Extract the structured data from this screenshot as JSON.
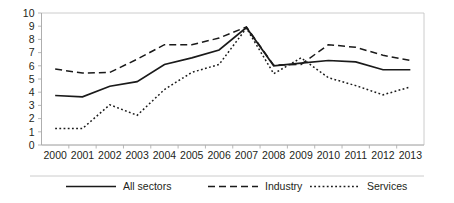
{
  "chart_data": {
    "type": "line",
    "title": "",
    "xlabel": "",
    "ylabel": "",
    "grid": false,
    "legend_position": "bottom",
    "ylim": [
      0,
      10
    ],
    "yticks": [
      0,
      1,
      2,
      3,
      4,
      5,
      6,
      7,
      8,
      9,
      10
    ],
    "categories": [
      "2000",
      "2001",
      "2002",
      "2003",
      "2004",
      "2005",
      "2006",
      "2007",
      "2008",
      "2009",
      "2010",
      "2011",
      "2012",
      "2013"
    ],
    "series": [
      {
        "name": "All sectors",
        "style": "solid",
        "values": [
          3.75,
          3.65,
          4.45,
          4.8,
          6.1,
          6.6,
          7.2,
          8.9,
          6.0,
          6.2,
          6.4,
          6.3,
          5.7,
          5.7
        ]
      },
      {
        "name": "Industry",
        "style": "dashed",
        "values": [
          5.75,
          5.45,
          5.5,
          6.5,
          7.6,
          7.6,
          8.1,
          8.95,
          6.05,
          6.1,
          7.6,
          7.4,
          6.8,
          6.4
        ]
      },
      {
        "name": "Services",
        "style": "dotted",
        "values": [
          1.25,
          1.25,
          3.05,
          2.25,
          4.2,
          5.5,
          6.1,
          8.85,
          5.4,
          6.6,
          5.1,
          4.5,
          3.8,
          4.4
        ]
      }
    ]
  },
  "axis": {
    "y_tick_labels": [
      "10",
      "9",
      "8",
      "7",
      "6",
      "5",
      "4",
      "3",
      "2",
      "1",
      "0"
    ],
    "x_tick_labels": [
      "2000",
      "2001",
      "2002",
      "2003",
      "2004",
      "2005",
      "2006",
      "2007",
      "2008",
      "2009",
      "2010",
      "2011",
      "2012",
      "2013"
    ]
  },
  "legend": {
    "items": [
      {
        "label": "All sectors",
        "style": "solid"
      },
      {
        "label": "Industry",
        "style": "dashed"
      },
      {
        "label": "Services",
        "style": "dotted"
      }
    ]
  },
  "colors": {
    "line": "#1a1a1a",
    "axis": "#a6a6a6",
    "border": "#bfbfbf",
    "text": "#231f20",
    "background": "#ffffff"
  }
}
